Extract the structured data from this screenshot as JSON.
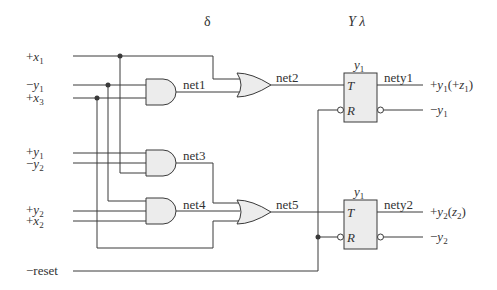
{
  "headers": {
    "delta": "δ",
    "y_lambda": "Y  λ"
  },
  "inputs": [
    {
      "sign": "+",
      "var": "x",
      "sub": "1"
    },
    {
      "sign": "−",
      "var": "y",
      "sub": "1"
    },
    {
      "sign": "+",
      "var": "x",
      "sub": "3"
    },
    {
      "sign": "+",
      "var": "y",
      "sub": "1"
    },
    {
      "sign": "−",
      "var": "y",
      "sub": "2"
    },
    {
      "sign": "+",
      "var": "y",
      "sub": "2"
    },
    {
      "sign": "+",
      "var": "x",
      "sub": "2"
    }
  ],
  "reset_label": "−reset",
  "nets": {
    "net1": "net1",
    "net2": "net2",
    "net3": "net3",
    "net4": "net4",
    "net5": "net5",
    "nety1": "nety1",
    "nety2": "nety2"
  },
  "flipflops": [
    {
      "name": "y",
      "sub": "1",
      "t_pin": "T",
      "r_pin": "R"
    },
    {
      "name": "y",
      "sub": "1",
      "t_pin": "T",
      "r_pin": "R"
    }
  ],
  "outputs": {
    "ff1_q": {
      "sign": "+",
      "var": "y",
      "sub": "1",
      "extra_open": "(+",
      "extra_var": "z",
      "extra_sub": "1",
      "extra_close": ")"
    },
    "ff1_qn": {
      "sign": "−",
      "var": "y",
      "sub": "1"
    },
    "ff2_q": {
      "sign": "+",
      "var": "y",
      "sub": "2",
      "extra_open": "(",
      "extra_var": "z",
      "extra_sub": "2",
      "extra_close": ")"
    },
    "ff2_qn": {
      "sign": "−",
      "var": "y",
      "sub": "2"
    }
  },
  "colors": {
    "wire": "#3a3a3a",
    "gate_fill": "#ececec",
    "background": "#ffffff"
  }
}
